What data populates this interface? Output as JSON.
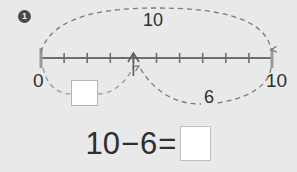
{
  "problem": {
    "number": "1"
  },
  "number_line": {
    "start_label": "0",
    "end_label": "10",
    "min": 0,
    "max": 10,
    "tick_count": 11,
    "pointer_value": 4
  },
  "arcs": {
    "top": {
      "label": "10",
      "from": 0,
      "to": 10,
      "style": "dashed",
      "name": "total-arc"
    },
    "bottom_right": {
      "label": "6",
      "from": 10,
      "to": 4,
      "style": "dashed",
      "name": "subtrahend-arc"
    },
    "bottom_left": {
      "label": "",
      "from": 0,
      "to": 4,
      "style": "dashed",
      "name": "difference-arc"
    }
  },
  "boxes": {
    "arc_answer": "",
    "equation_answer": ""
  },
  "equation": {
    "minuend": "10",
    "operator": "−",
    "subtrahend": "6",
    "equals": "=",
    "answer": ""
  },
  "colors": {
    "background": "#e9e9e9",
    "line": "#6e6e6e",
    "text": "#2e2e2e",
    "badge": "#4a4a4a",
    "box_fill": "#ffffff",
    "box_border": "#b6b6b6"
  }
}
